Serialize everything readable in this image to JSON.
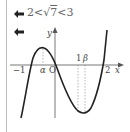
{
  "margin_rule": true,
  "notes": [
    {
      "bullet": "arrow-left",
      "text": "2<√7<3",
      "parts": {
        "left": "2<",
        "radical_sign": "√",
        "radicand": "7",
        "right": "<3"
      }
    },
    {
      "bullet": "arrow-left",
      "text": ""
    }
  ],
  "graph": {
    "axis_labels": {
      "x": "x",
      "y": "y",
      "origin": "O"
    },
    "tick_labels": {
      "minus_one": "−1",
      "alpha": "α",
      "one": "1",
      "beta": "β",
      "two": "2"
    },
    "curve": "cubic with local max at α (between −1 and 0) and local min at β (between 1 and 2), roots at −1, 0, 2",
    "colors": {
      "curve": "#222222",
      "axis": "#555555",
      "dotted": "#999999",
      "rule": "#bdbdbd"
    }
  }
}
